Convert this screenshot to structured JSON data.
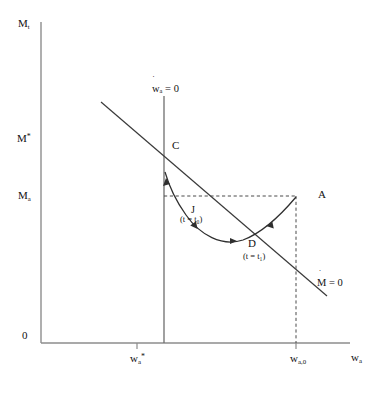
{
  "figure": {
    "type": "phase-diagram",
    "axes": {
      "y_title": "M",
      "y_title_sub": "t",
      "x_title": "w",
      "x_title_sub": "a",
      "origin_label": "0",
      "y_ticks": [
        {
          "id": "m-star",
          "label": "M",
          "sup": "*",
          "sub": "",
          "value_y_px": 138
        },
        {
          "id": "m-a",
          "label": "M",
          "sup": "",
          "sub": "a",
          "value_y_px": 196
        }
      ],
      "x_ticks": [
        {
          "id": "w-a-star",
          "label": "w",
          "sub": "a",
          "sup": "*",
          "value_x_px": 137
        },
        {
          "id": "w-a-0",
          "label": "w",
          "sub": "a,0",
          "sup": "",
          "value_x_px": 296
        }
      ]
    },
    "isoclines": [
      {
        "id": "w-dot-zero",
        "label_prefix": "w",
        "label_sub": "a",
        "label_suffix": "= 0",
        "orientation": "vertical"
      },
      {
        "id": "m-dot-zero",
        "label_prefix": "M",
        "label_sub": "",
        "label_suffix": "= 0",
        "orientation": "downward-sloping"
      }
    ],
    "points": [
      {
        "id": "C",
        "label": "C",
        "annotation": ""
      },
      {
        "id": "A",
        "label": "A",
        "annotation": ""
      },
      {
        "id": "D",
        "label": "D",
        "annotation": "(t = t₁)"
      },
      {
        "id": "J",
        "label": "J",
        "annotation": "(t = t₀)"
      }
    ],
    "annotations": {
      "t0": "(t = t₀)",
      "t1": "(t = t₁)"
    },
    "caption": "",
    "colors": {
      "line": "#3a3a3a",
      "axis": "#8d8d8d",
      "dashed": "#4a4a4a",
      "text": "#111111"
    }
  }
}
